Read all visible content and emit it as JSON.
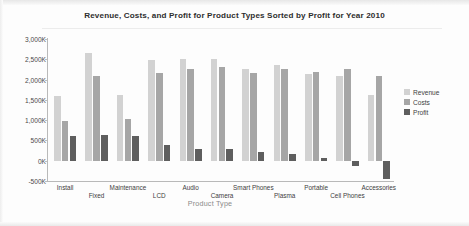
{
  "chart_data": {
    "type": "bar",
    "title": "Revenue, Costs, and Profit for Product Types Sorted by Profit for Year 2010",
    "xlabel": "Product Type",
    "ylabel": "",
    "grid": false,
    "legend_position": "right",
    "ylim": [
      -500000,
      3000000
    ],
    "ytick_values": [
      3000000,
      2500000,
      2000000,
      1500000,
      1000000,
      500000,
      0,
      -500000
    ],
    "ytick_labels": [
      "3,000K",
      "2,500K",
      "2,000K",
      "1,500K",
      "1,000K",
      "500K",
      "0K",
      "-500K"
    ],
    "categories": [
      "Install",
      "Fixed",
      "Maintenance",
      "LCD",
      "Audio",
      "Camera",
      "Smart Phones",
      "Plasma",
      "Portable",
      "Cell Phones",
      "Accessories"
    ],
    "series": [
      {
        "name": "Revenue",
        "color": "#d2d2d2",
        "values": [
          1600000,
          2660000,
          1620000,
          2480000,
          2510000,
          2500000,
          2270000,
          2360000,
          2130000,
          2080000,
          1620000
        ]
      },
      {
        "name": "Costs",
        "color": "#a6a6a6",
        "values": [
          990000,
          2100000,
          1040000,
          2150000,
          2270000,
          2300000,
          2170000,
          2270000,
          2190000,
          2270000,
          2090000
        ]
      },
      {
        "name": "Profit",
        "color": "#5e5e5e",
        "values": [
          620000,
          630000,
          620000,
          380000,
          290000,
          285000,
          225000,
          160000,
          55000,
          -130000,
          -450000
        ]
      }
    ]
  },
  "legend": {
    "items": [
      {
        "label": "Revenue"
      },
      {
        "label": "Costs"
      },
      {
        "label": "Profit"
      }
    ]
  }
}
